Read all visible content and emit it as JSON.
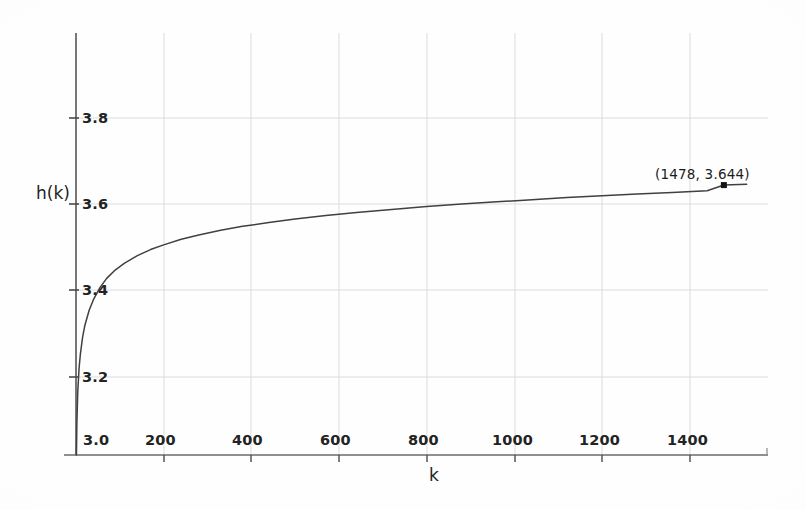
{
  "figure": {
    "background_color": "#fefefe",
    "ink_color": "#3a3a3a",
    "grid_color": "#d8d8d8",
    "curve_color": "#404040"
  },
  "chart_data": {
    "type": "line",
    "title": "",
    "xlabel": "k",
    "ylabel": "h(k)",
    "xlim": [
      0,
      1560
    ],
    "ylim": [
      3.0,
      3.9
    ],
    "grid": true,
    "legend": null,
    "x_ticks": [
      200,
      400,
      600,
      800,
      1000,
      1200,
      1400
    ],
    "x_tick_labels": [
      "200",
      "400",
      "600",
      "800",
      "1000",
      "1200",
      "1400"
    ],
    "y_ticks": [
      3.2,
      3.4,
      3.6,
      3.8
    ],
    "y_tick_labels": [
      "3.2",
      "3.4",
      "3.6",
      "3.8"
    ],
    "origin_label": "3.0",
    "series": [
      {
        "name": "h(k)",
        "x": [
          1,
          2,
          4,
          7,
          10,
          15,
          20,
          30,
          40,
          55,
          70,
          90,
          110,
          140,
          170,
          200,
          240,
          280,
          330,
          380,
          440,
          500,
          570,
          640,
          720,
          800,
          880,
          960,
          1040,
          1120,
          1200,
          1280,
          1360,
          1440,
          1478,
          1530
        ],
        "y": [
          3.0,
          3.09,
          3.163,
          3.218,
          3.251,
          3.29,
          3.317,
          3.353,
          3.378,
          3.406,
          3.427,
          3.447,
          3.462,
          3.48,
          3.494,
          3.505,
          3.518,
          3.528,
          3.539,
          3.548,
          3.557,
          3.565,
          3.573,
          3.58,
          3.587,
          3.594,
          3.6,
          3.605,
          3.61,
          3.615,
          3.619,
          3.623,
          3.627,
          3.631,
          3.644,
          3.646
        ]
      }
    ],
    "annotations": [
      {
        "text": "(1478,  3.644)",
        "x": 1478,
        "y": 3.644,
        "marker": "square-dot"
      }
    ]
  },
  "labels": {
    "y_axis_title": "h(k)",
    "x_axis_title": "k",
    "origin": "3.0",
    "y_3_8": "3.8",
    "y_3_6": "3.6",
    "y_3_4": "3.4",
    "y_3_2": "3.2",
    "x_200": "200",
    "x_400": "400",
    "x_600": "600",
    "x_800": "800",
    "x_1000": "1000",
    "x_1200": "1200",
    "x_1400": "1400",
    "annotation": "(1478,  3.644)"
  }
}
